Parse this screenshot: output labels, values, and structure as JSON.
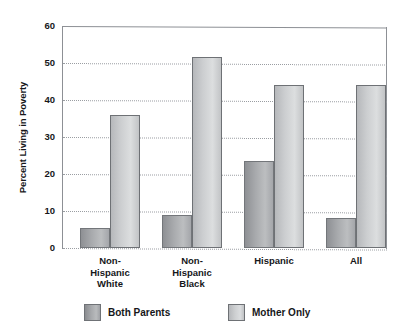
{
  "chart_data": {
    "type": "bar",
    "title": "",
    "xlabel": "",
    "ylabel": "Percent Living in Poverty",
    "ylim": [
      0,
      60
    ],
    "yticks": [
      60,
      50,
      40,
      30,
      20,
      10,
      0
    ],
    "grid": true,
    "grid_style": "dotted-horizontal",
    "legend_position": "below-plot-left",
    "categories": [
      "Non-\nHispanic\nWhite",
      "Non-\nHispanic\nBlack",
      "Hispanic",
      "All"
    ],
    "series": [
      {
        "name": "Both Parents",
        "color": "#a8aaad",
        "values": [
          5.5,
          9,
          23.5,
          8
        ]
      },
      {
        "name": "Mother Only",
        "color": "#d2d4d6",
        "values": [
          36,
          51.5,
          44,
          44
        ]
      }
    ]
  },
  "legend": {
    "entries": [
      {
        "label": "Both Parents",
        "swatch": "both"
      },
      {
        "label": "Mother Only",
        "swatch": "mother"
      }
    ]
  },
  "colors": {
    "axis": "#8d9095",
    "grid": "#9a9da2",
    "text": "#16171a",
    "background": "#ffffff"
  }
}
